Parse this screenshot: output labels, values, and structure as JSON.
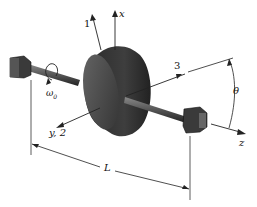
{
  "diagram": {
    "labels": {
      "axis_x": "x",
      "axis_1": "1",
      "axis_3": "3",
      "axis_y2": "y, 2",
      "axis_z": "z",
      "omega": "ω",
      "omega_sub": "0",
      "theta": "θ",
      "length": "L"
    },
    "colors": {
      "line": "#222222",
      "disk_dark": "#2a2a2a",
      "disk_mid": "#4a4a4a",
      "disk_face": "#5c5c5c",
      "bearing": "#3a3a3a"
    }
  }
}
